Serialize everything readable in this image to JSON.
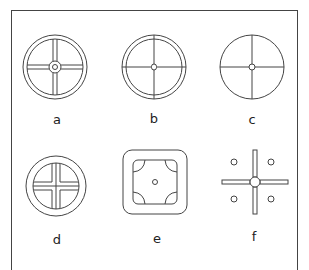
{
  "figures": [
    {
      "id": "a",
      "label": "a",
      "description": "double-ring wheel with double-line cross spokes and ringed hub"
    },
    {
      "id": "b",
      "label": "b",
      "description": "double-ring wheel with single-line cross and small hub"
    },
    {
      "id": "c",
      "label": "c",
      "description": "single circle with single-line cross and small central circle"
    },
    {
      "id": "d",
      "label": "d",
      "description": "double ring with inner cross formed by four quadrant shapes"
    },
    {
      "id": "e",
      "label": "e",
      "description": "rounded square containing rounded square with concave corner arcs and central dot"
    },
    {
      "id": "f",
      "label": "f",
      "description": "double-line cross with central circle and four small circles in quadrants"
    }
  ],
  "colors": {
    "stroke": "#444444",
    "background": "#ffffff"
  }
}
